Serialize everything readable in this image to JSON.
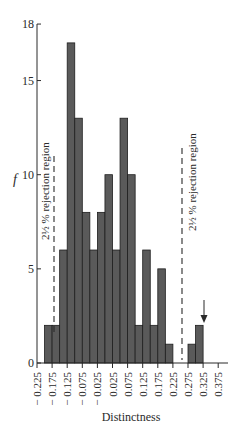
{
  "chart_data": {
    "type": "bar",
    "subtype": "histogram",
    "title": "",
    "xlabel": "Distinctness",
    "ylabel": "f",
    "ylim": [
      0,
      18
    ],
    "yticks": [
      0,
      5,
      10,
      15,
      18
    ],
    "xlim": [
      -0.225,
      0.375
    ],
    "xticks": [
      "-0.225",
      "-0.175",
      "-0.125",
      "-0.075",
      "-0.025",
      "0.025",
      "0.075",
      "0.125",
      "0.175",
      "0.225",
      "0.275",
      "0.325",
      "0.375"
    ],
    "bin_width": 0.025,
    "bins": [
      {
        "start": -0.2,
        "end": -0.175,
        "count": 2
      },
      {
        "start": -0.175,
        "end": -0.15,
        "count": 2
      },
      {
        "start": -0.15,
        "end": -0.125,
        "count": 6
      },
      {
        "start": -0.125,
        "end": -0.1,
        "count": 17
      },
      {
        "start": -0.1,
        "end": -0.075,
        "count": 13
      },
      {
        "start": -0.075,
        "end": -0.05,
        "count": 8
      },
      {
        "start": -0.05,
        "end": -0.025,
        "count": 6
      },
      {
        "start": -0.025,
        "end": 0.0,
        "count": 8
      },
      {
        "start": 0.0,
        "end": 0.025,
        "count": 10
      },
      {
        "start": 0.025,
        "end": 0.05,
        "count": 6
      },
      {
        "start": 0.05,
        "end": 0.075,
        "count": 13
      },
      {
        "start": 0.075,
        "end": 0.1,
        "count": 10
      },
      {
        "start": 0.1,
        "end": 0.125,
        "count": 2
      },
      {
        "start": 0.125,
        "end": 0.15,
        "count": 6
      },
      {
        "start": 0.15,
        "end": 0.175,
        "count": 2
      },
      {
        "start": 0.175,
        "end": 0.2,
        "count": 5
      },
      {
        "start": 0.2,
        "end": 0.225,
        "count": 1
      },
      {
        "start": 0.275,
        "end": 0.3,
        "count": 1
      },
      {
        "start": 0.3,
        "end": 0.325,
        "count": 2
      }
    ],
    "annotations": [
      {
        "type": "dashed-line",
        "x": -0.175,
        "label": "2½ % rejection region"
      },
      {
        "type": "dashed-line",
        "x": 0.25,
        "label": "2½ % rejection region"
      },
      {
        "type": "arrow",
        "x": 0.3125,
        "points_to_count": 2
      }
    ],
    "grid": false,
    "legend": null
  },
  "labels": {
    "rejection_left": "2½ % rejection region",
    "rejection_right": "2½ % rejection region"
  },
  "colors": {
    "bar_fill": "#5a5a5a",
    "bar_edge": "#1e1e1e",
    "axis": "#2a2a2a",
    "background": "#ffffff"
  }
}
